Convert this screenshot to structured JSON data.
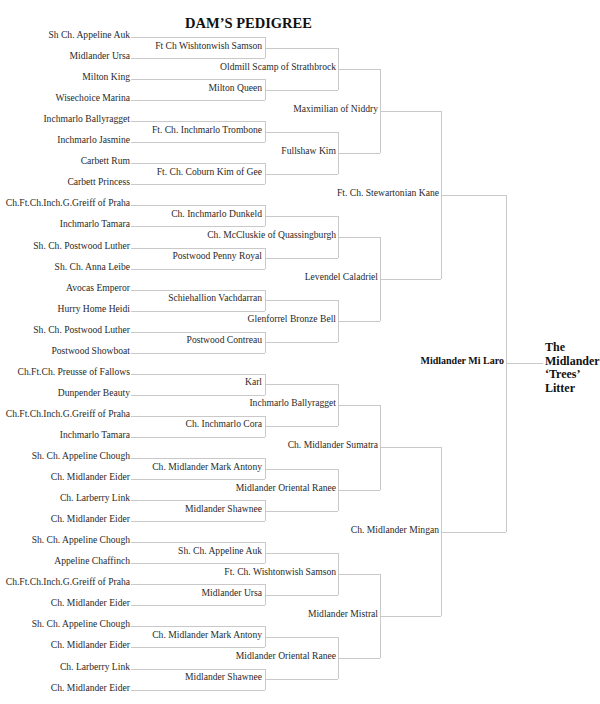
{
  "title": "DAM’S PEDIGREE",
  "litter": [
    "The",
    "Midlander",
    "‘Trees’",
    "Litter"
  ],
  "subject": "Midlander Mi Laro",
  "gen1": [
    "Ft. Ch. Stewartonian Kane",
    "Ch. Midlander Mingan"
  ],
  "gen2": [
    "Maximilian of Niddry",
    "Levendel Caladriel",
    "Ch. Midlander Sumatra",
    "Midlander Mistral"
  ],
  "gen3": [
    "Oldmill Scamp of Strathbrock",
    "Fullshaw Kim",
    "Ch. McCluskie of Quassingburgh",
    "Glenforrel Bronze Bell",
    "Inchmarlo Ballyragget",
    "Midlander Oriental Ranee",
    "Ft. Ch. Wishtonwish Samson",
    "Midlander Oriental Ranee"
  ],
  "gen4": [
    "Ft Ch  Wishtonwish Samson",
    "Milton Queen",
    "Ft. Ch. Inchmarlo Trombone",
    "Ft. Ch. Coburn Kim of Gee",
    "Ch. Inchmarlo Dunkeld",
    "Postwood Penny Royal",
    "Schiehallion Vachdarran",
    "Postwood Contreau",
    "Karl",
    "Ch. Inchmarlo Cora",
    "Ch. Midlander Mark Antony",
    "Midlander Shawnee",
    "Sh. Ch. Appeline Auk",
    "Midlander Ursa",
    "Ch. Midlander Mark Antony",
    "Midlander Shawnee"
  ],
  "gen5": [
    "Sh  Ch. Appeline Auk",
    "Midlander Ursa",
    "Milton King",
    "Wisechoice Marina",
    "Inchmarlo Ballyragget",
    "Inchmarlo Jasmine",
    "Carbett Rum",
    "Carbett Princess",
    "Ch.Ft.Ch.Inch.G.Greiff of Praha",
    "Inchmarlo Tamara",
    "Sh. Ch. Postwood Luther",
    "Sh. Ch. Anna Leibe",
    "Avocas Emperor",
    "Hurry Home Heidi",
    "Sh. Ch. Postwood Luther",
    "Postwood Showboat",
    "Ch.Ft.Ch. Preusse of Fallows",
    "Dunpender Beauty",
    "Ch.Ft.Ch.Inch.G.Greiff of Praha",
    "Inchmarlo Tamara",
    "Sh. Ch. Appeline Chough",
    "Ch. Midlander Eider",
    "Ch. Larberry Link",
    "Ch. Midlander Eider",
    "Sh. Ch. Appeline Chough",
    "Appeline Chaffinch",
    "Ch.Ft.Ch.Inch.G.Greiff of Praha",
    "Ch. Midlander Eider",
    "Sh. Ch. Appeline Chough",
    "Ch. Midlander Eider",
    "Ch. Larberry Link",
    "Ch. Midlander Eider"
  ],
  "line_color": "#c9c9c9"
}
